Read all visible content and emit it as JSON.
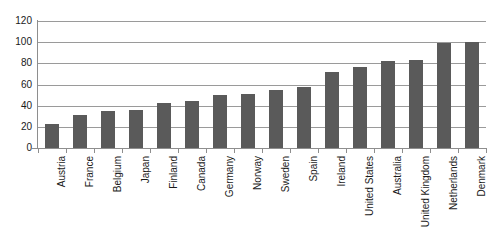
{
  "chart_data": {
    "type": "bar",
    "title": "",
    "subtitle": "",
    "xlabel": "",
    "ylabel": "",
    "ylim": [
      0,
      120
    ],
    "ytick_step": 20,
    "yticks": [
      "120",
      "100",
      "80",
      "60",
      "40",
      "20",
      "0"
    ],
    "grid": true,
    "legend": false,
    "legend_position": "none",
    "bar_color": "#5a5a5a",
    "gridline_color": "#9a9a9a",
    "axis_color": "#8e8e8e",
    "background_color": "#ffffff",
    "xtick_rotation": -90,
    "categories": [
      "Austria",
      "France",
      "Belgium",
      "Japan",
      "Finland",
      "Canada",
      "Germany",
      "Norway",
      "Sweden",
      "Spain",
      "Ireland",
      "United States",
      "Australia",
      "United Kingdom",
      "Netherlands",
      "Denmark"
    ],
    "values": [
      23,
      31,
      35,
      36,
      43,
      44,
      50,
      51,
      55,
      58,
      72,
      77,
      82,
      83,
      99,
      100
    ]
  }
}
